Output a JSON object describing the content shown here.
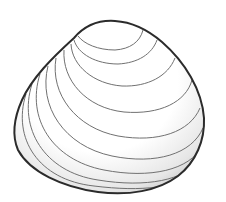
{
  "illustration": {
    "subject": "clam shell line drawing",
    "outline_color": "#2b2b2b",
    "ring_color": "#6a6a6a",
    "shade_color": "#c8c8c8",
    "background": "#ffffff",
    "ring_count": 10
  }
}
